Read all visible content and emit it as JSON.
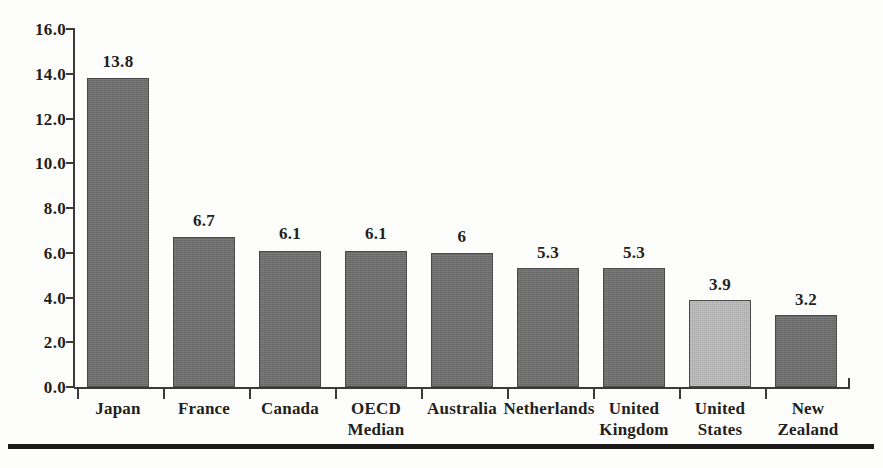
{
  "chart_data": {
    "type": "bar",
    "title": "",
    "subtitle": "",
    "xlabel": "",
    "ylabel": "",
    "categories": [
      "Japan",
      "France",
      "Canada",
      "OECD\nMedian",
      "Australia",
      "Netherlands",
      "United\nKingdom",
      "United\nStates",
      "New\nZealand"
    ],
    "category_lines": [
      [
        "Japan"
      ],
      [
        "France"
      ],
      [
        "Canada"
      ],
      [
        "OECD",
        "Median"
      ],
      [
        "Australia"
      ],
      [
        "Netherlands"
      ],
      [
        "United",
        "Kingdom"
      ],
      [
        "United",
        "States"
      ],
      [
        "New",
        "Zealand"
      ]
    ],
    "values": [
      13.8,
      6.7,
      6.1,
      6.1,
      6,
      5.3,
      5.3,
      3.9,
      3.2
    ],
    "value_labels": [
      "13.8",
      "6.7",
      "6.1",
      "6.1",
      "6",
      "5.3",
      "5.3",
      "3.9",
      "3.2"
    ],
    "highlight_index": 7,
    "bar_colors": [
      "#6e6e6e",
      "#6e6e6e",
      "#6e6e6e",
      "#6e6e6e",
      "#6e6e6e",
      "#6e6e6e",
      "#6e6e6e",
      "#b6b6b6",
      "#6e6e6e"
    ],
    "ylim": [
      0,
      16
    ],
    "ytick_step": 2,
    "yticks": [
      0,
      2,
      4,
      6,
      8,
      10,
      12,
      14,
      16
    ],
    "ytick_labels": [
      "0.0",
      "2.0",
      "4.0",
      "6.0",
      "8.0",
      "10.0",
      "12.0",
      "14.0",
      "16.0"
    ],
    "grid": false,
    "legend": null,
    "legend_position": "none",
    "axis_color": "#3a3a3a",
    "text_color": "#231f20",
    "background_color": "#fdfdfc",
    "rule_color": "#1b1b1b"
  }
}
